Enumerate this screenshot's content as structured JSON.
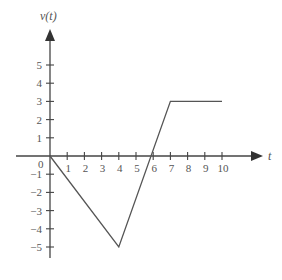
{
  "chart_data": {
    "type": "line",
    "title": "",
    "xlabel": "t",
    "ylabel": "v(t)",
    "xlim": [
      0,
      10
    ],
    "ylim": [
      -6,
      6
    ],
    "grid": false,
    "x_ticks": [
      "1",
      "2",
      "3",
      "4",
      "5",
      "6",
      "7",
      "8",
      "9",
      "10"
    ],
    "y_ticks": [
      "5",
      "4",
      "3",
      "2",
      "1",
      "0",
      "-1",
      "-2",
      "-3",
      "-4",
      "-5"
    ],
    "series": [
      {
        "name": "v(t)",
        "x": [
          0,
          4,
          7,
          10
        ],
        "values": [
          0,
          -5,
          3,
          3
        ]
      }
    ],
    "line_color": "#555555",
    "axis_color": "#444444"
  },
  "labels": {
    "y_axis": "v(t)",
    "x_axis": "t",
    "origin": "0"
  }
}
